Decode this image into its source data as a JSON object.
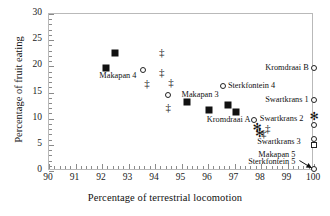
{
  "chart_data": {
    "type": "scatter",
    "title": "",
    "xlabel": "Percentage of terrestrial locomotion",
    "ylabel": "Percentage of fruit eating",
    "xlim": [
      90,
      100
    ],
    "ylim": [
      0,
      30
    ],
    "xticks": [
      90,
      91,
      92,
      93,
      94,
      95,
      96,
      97,
      98,
      99,
      100
    ],
    "yticks": [
      0,
      5,
      10,
      15,
      20,
      25,
      30
    ],
    "x_minor_per_major": 5,
    "y_minor_per_major": 5,
    "grid": false,
    "legend": "none",
    "marker_types": [
      "filled-diamond",
      "open-circle",
      "double-dagger",
      "asterisk",
      "open-square"
    ],
    "points": [
      {
        "x": 92.15,
        "y": 19.7,
        "marker": "filled-diamond"
      },
      {
        "x": 92.5,
        "y": 22.6,
        "marker": "filled-diamond"
      },
      {
        "x": 95.2,
        "y": 13.2,
        "marker": "filled-diamond"
      },
      {
        "x": 96.05,
        "y": 11.7,
        "marker": "filled-diamond"
      },
      {
        "x": 96.75,
        "y": 12.7,
        "marker": "filled-diamond"
      },
      {
        "x": 97.05,
        "y": 11.3,
        "marker": "filled-diamond"
      },
      {
        "x": 93.55,
        "y": 19.3,
        "marker": "open-circle"
      },
      {
        "x": 94.5,
        "y": 14.5,
        "marker": "open-circle"
      },
      {
        "x": 96.55,
        "y": 16.3,
        "marker": "open-circle"
      },
      {
        "x": 97.75,
        "y": 9.7,
        "marker": "open-circle"
      },
      {
        "x": 100.0,
        "y": 19.7,
        "marker": "open-circle"
      },
      {
        "x": 100.0,
        "y": 13.6,
        "marker": "open-circle"
      },
      {
        "x": 100.0,
        "y": 8.7,
        "marker": "open-circle"
      },
      {
        "x": 100.0,
        "y": 6.2,
        "marker": "open-circle"
      },
      {
        "x": 100.0,
        "y": 0.3,
        "marker": "open-circle"
      },
      {
        "x": 93.7,
        "y": 16.9,
        "marker": "double-dagger"
      },
      {
        "x": 94.25,
        "y": 22.8,
        "marker": "double-dagger"
      },
      {
        "x": 94.25,
        "y": 19.0,
        "marker": "double-dagger"
      },
      {
        "x": 94.6,
        "y": 17.1,
        "marker": "double-dagger"
      },
      {
        "x": 94.5,
        "y": 12.2,
        "marker": "double-dagger"
      },
      {
        "x": 98.25,
        "y": 8.2,
        "marker": "double-dagger"
      },
      {
        "x": 98.1,
        "y": 7.2,
        "marker": "double-dagger"
      },
      {
        "x": 97.85,
        "y": 8.5,
        "marker": "asterisk"
      },
      {
        "x": 97.95,
        "y": 7.2,
        "marker": "asterisk"
      },
      {
        "x": 100.0,
        "y": 10.6,
        "marker": "asterisk"
      },
      {
        "x": 100.0,
        "y": 5.0,
        "marker": "open-square"
      }
    ],
    "annotations": [
      {
        "text": "Makapan 4",
        "x": 92.6,
        "y": 18.2,
        "align": "center"
      },
      {
        "text": "Makapan 3",
        "x": 95.0,
        "y": 14.6,
        "align": "left"
      },
      {
        "text": "Sterkfontein 4",
        "x": 96.75,
        "y": 16.3,
        "align": "left"
      },
      {
        "text": "Kromdraai A",
        "x": 97.6,
        "y": 9.7,
        "align": "right"
      },
      {
        "text": "Kromdraai B",
        "x": 99.8,
        "y": 19.7,
        "align": "right"
      },
      {
        "text": "Swartkrans 1",
        "x": 99.8,
        "y": 13.6,
        "align": "right"
      },
      {
        "text": "Swartkrans 2",
        "x": 99.6,
        "y": 10.0,
        "align": "right"
      },
      {
        "text": "Swartkrans 3",
        "x": 99.5,
        "y": 5.6,
        "align": "right"
      },
      {
        "text": "Makapan 5",
        "x": 99.3,
        "y": 3.1,
        "align": "right"
      },
      {
        "text": "Sterkfontein 5",
        "x": 99.3,
        "y": 1.7,
        "align": "right"
      }
    ],
    "leader_arrow": {
      "from_x": 99.45,
      "from_y": 2.0,
      "to_x": 99.92,
      "to_y": 0.55
    }
  }
}
